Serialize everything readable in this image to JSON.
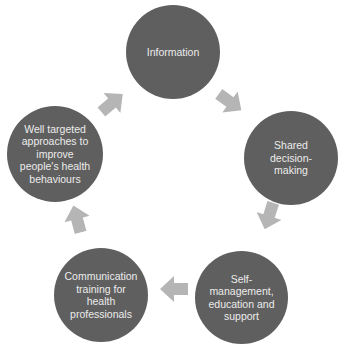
{
  "diagram": {
    "type": "cycle",
    "colors": {
      "node_fill": "#5f5f5f",
      "node_text": "#ececec",
      "arrow_fill": "#b5b5b5",
      "background": "#ffffff"
    },
    "nodes": [
      {
        "id": "information",
        "label": "Information"
      },
      {
        "id": "shared-decision-making",
        "label": "Shared decision-making",
        "lines": [
          "Shared",
          "decision-",
          "making"
        ]
      },
      {
        "id": "self-management",
        "label": "Self-management, education and support",
        "lines": [
          "Self-",
          "management,",
          "education and",
          "support"
        ]
      },
      {
        "id": "communication-training",
        "label": "Communication training for health professionals",
        "lines": [
          "Communication",
          "training for",
          "health",
          "professionals"
        ]
      },
      {
        "id": "well-targeted-approaches",
        "label": "Well targeted approaches to improve people's health behaviours",
        "lines": [
          "Well targeted",
          "approaches to",
          "improve",
          "people's health",
          "behaviours"
        ]
      }
    ],
    "edges": [
      {
        "from": "information",
        "to": "shared-decision-making"
      },
      {
        "from": "shared-decision-making",
        "to": "self-management"
      },
      {
        "from": "self-management",
        "to": "communication-training"
      },
      {
        "from": "communication-training",
        "to": "well-targeted-approaches"
      },
      {
        "from": "well-targeted-approaches",
        "to": "information"
      }
    ]
  }
}
